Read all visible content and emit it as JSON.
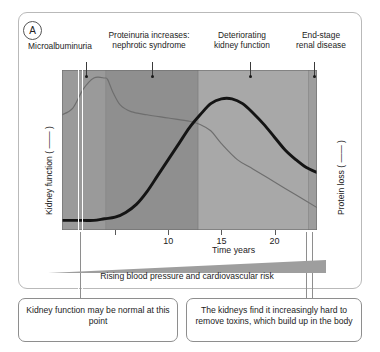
{
  "panel": {
    "letter": "A"
  },
  "stages": [
    {
      "label": "Microalbuminuria",
      "leader_x": 86,
      "dot_x": 86,
      "label_bottom_y": 62
    },
    {
      "label": "Proteinuria increases:\nnephrotic  syndrome",
      "leader_x": 152,
      "dot_x": 152,
      "label_bottom_y": 62
    },
    {
      "label": "Deteriorating\nkidney function",
      "leader_x": 250,
      "dot_x": 250,
      "label_bottom_y": 62
    },
    {
      "label": "End-stage\nrenal disease",
      "leader_x": 314,
      "dot_x": 314,
      "label_bottom_y": 62
    }
  ],
  "axes": {
    "y_left_label": "Kidney function ( —— )",
    "y_right_label": "Protein loss ( —— )",
    "x_caption": "Time years"
  },
  "wedge": {
    "caption": "Rising blood pressure and cardiovascular risk"
  },
  "callouts": [
    {
      "text": "Kidney function may be normal at this point"
    },
    {
      "text": "The kidneys find it increasingly hard to remove toxins, which build up in the body"
    }
  ],
  "colors": {
    "band_1": "#9a9a9a",
    "band_2": "#8f8f8f",
    "band_3": "#a8a8a8",
    "band_4": "#9d9d9d",
    "kidney_curve": "#6e6e6e",
    "protein_curve": "#141414",
    "wedge": "#9e9e9e",
    "panel_border": "#b9b9b9",
    "callout_border": "#8e8e8e"
  },
  "chart_data": {
    "type": "line",
    "title": "",
    "xlabel": "Time years",
    "ylabel": "Kidney function ( —— )",
    "y2label": "Protein loss ( —— )",
    "xlim": [
      0,
      24
    ],
    "ylim": [
      0,
      100
    ],
    "grid": false,
    "legend_position": "axis-labels",
    "xticks": [
      5,
      10,
      15,
      20
    ],
    "xtick_labels": [
      "",
      "10",
      "15",
      "20"
    ],
    "bands": [
      {
        "name": "Microalbuminuria",
        "x_start": 0,
        "x_end": 4.1,
        "shade": "#9a9a9a"
      },
      {
        "name": "Proteinuria increases: nephrotic syndrome",
        "x_start": 4.1,
        "x_end": 12.8,
        "shade": "#8f8f8f"
      },
      {
        "name": "Deteriorating kidney function",
        "x_start": 12.8,
        "x_end": 23.2,
        "shade": "#a8a8a8"
      },
      {
        "name": "End-stage renal disease",
        "x_start": 23.2,
        "x_end": 24.0,
        "shade": "#9d9d9d"
      }
    ],
    "series": [
      {
        "name": "Kidney function ( —— )",
        "style": "thin",
        "color": "#6e6e6e",
        "axis": "left",
        "x": [
          0,
          1,
          2,
          3,
          4,
          4.3,
          4.8,
          5.5,
          6.5,
          8,
          10,
          12,
          13,
          14,
          15,
          16.5,
          18,
          20,
          22,
          24
        ],
        "y": [
          72,
          76,
          88,
          95,
          95,
          94,
          86,
          78,
          74,
          72,
          70,
          68,
          66,
          62,
          54,
          44,
          38,
          30,
          22,
          14
        ]
      },
      {
        "name": "Protein loss ( —— )",
        "style": "thick",
        "color": "#141414",
        "axis": "right",
        "x": [
          0,
          1,
          2,
          3,
          4,
          5,
          6,
          7,
          8,
          9,
          10,
          11,
          12,
          13,
          14,
          15,
          16,
          17,
          18,
          19,
          20,
          21,
          22,
          23,
          24
        ],
        "y": [
          6,
          6,
          6,
          6,
          7,
          8,
          11,
          16,
          24,
          34,
          44,
          54,
          64,
          72,
          79,
          82,
          82,
          79,
          73,
          66,
          58,
          50,
          44,
          39,
          36
        ]
      }
    ]
  }
}
